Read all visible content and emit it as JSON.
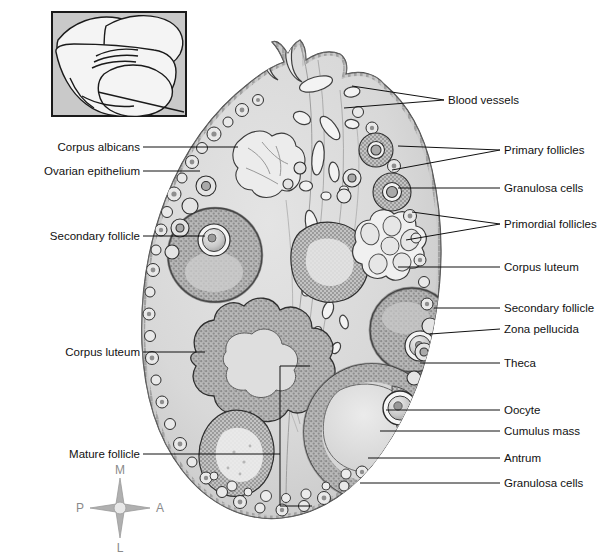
{
  "figure": {
    "kind": "anatomical-illustration",
    "background_color": "#ffffff",
    "line_color": "#111111",
    "stroma_fill": "#d9d9d9",
    "cortex_fill": "#cfcfcf",
    "follicle_fill": "#b4b4b4",
    "lumen_fill": "#e3e3e3",
    "vessel_fill": "#f2f2f2"
  },
  "inset": {
    "name": "orientation-inset",
    "description": "Hand holding ovary with sectioning plane line",
    "border_color": "#1a1a1a",
    "fill": "#c9c9c9"
  },
  "labels_left": [
    {
      "id": "corpus-albicans",
      "text": "Corpus albicans",
      "text_x": 140,
      "text_y": 151,
      "line_x1": 143,
      "line_y1": 147,
      "line_x2": 238,
      "line_y2": 147,
      "fork": false
    },
    {
      "id": "ovarian-epithelium",
      "text": "Ovarian epithelium",
      "text_x": 140,
      "text_y": 175,
      "line_x1": 143,
      "line_y1": 171,
      "line_x2": 200,
      "line_y2": 171,
      "fork": false
    },
    {
      "id": "secondary-follicle-left",
      "text": "Secondary follicle",
      "text_x": 140,
      "text_y": 240,
      "line_x1": 143,
      "line_y1": 236,
      "line_x2": 205,
      "line_y2": 236,
      "fork": false
    },
    {
      "id": "corpus-luteum-left",
      "text": "Corpus luteum",
      "text_x": 140,
      "text_y": 356,
      "line_x1": 143,
      "line_y1": 352,
      "line_x2": 205,
      "line_y2": 352,
      "fork": false
    },
    {
      "id": "mature-follicle",
      "text": "Mature follicle",
      "text_x": 140,
      "text_y": 458,
      "line_x1": 143,
      "line_y1": 454,
      "line_x2": 280,
      "line_y2": 454,
      "fork": false
    }
  ],
  "labels_right": [
    {
      "id": "blood-vessels",
      "text": "Blood vessels",
      "text_x": 448,
      "text_y": 104,
      "line_x1": 444,
      "line_y1": 100,
      "line_x2": 352,
      "line_y2": 86,
      "fork": true,
      "fork_x2": 344,
      "fork_y2": 108
    },
    {
      "id": "primary-follicles",
      "text": "Primary follicles",
      "text_x": 504,
      "text_y": 154,
      "line_x1": 500,
      "line_y1": 150,
      "line_x2": 398,
      "line_y2": 146,
      "fork": true,
      "fork_x2": 392,
      "fork_y2": 170
    },
    {
      "id": "granulosa-cells-top",
      "text": "Granulosa cells",
      "text_x": 504,
      "text_y": 192,
      "line_x1": 500,
      "line_y1": 188,
      "line_x2": 398,
      "line_y2": 188,
      "fork": false
    },
    {
      "id": "primordial-follicles",
      "text": "Primordial follicles",
      "text_x": 504,
      "text_y": 228,
      "line_x1": 500,
      "line_y1": 224,
      "line_x2": 412,
      "line_y2": 212,
      "fork": true,
      "fork_x2": 406,
      "fork_y2": 240
    },
    {
      "id": "corpus-luteum-right",
      "text": "Corpus luteum",
      "text_x": 504,
      "text_y": 271,
      "line_x1": 500,
      "line_y1": 267,
      "line_x2": 398,
      "line_y2": 267,
      "fork": false
    },
    {
      "id": "secondary-follicle-right",
      "text": "Secondary follicle",
      "text_x": 504,
      "text_y": 312,
      "line_x1": 500,
      "line_y1": 308,
      "line_x2": 434,
      "line_y2": 308,
      "fork": false
    },
    {
      "id": "zona-pellucida",
      "text": "Zona pellucida",
      "text_x": 504,
      "text_y": 333,
      "line_x1": 500,
      "line_y1": 329,
      "line_x2": 430,
      "line_y2": 334,
      "fork": false
    },
    {
      "id": "theca",
      "text": "Theca",
      "text_x": 504,
      "text_y": 367,
      "line_x1": 500,
      "line_y1": 363,
      "line_x2": 420,
      "line_y2": 363,
      "fork": false
    },
    {
      "id": "oocyte",
      "text": "Oocyte",
      "text_x": 504,
      "text_y": 414,
      "line_x1": 500,
      "line_y1": 410,
      "line_x2": 386,
      "line_y2": 410,
      "fork": false
    },
    {
      "id": "cumulus-mass",
      "text": "Cumulus mass",
      "text_x": 504,
      "text_y": 435,
      "line_x1": 500,
      "line_y1": 431,
      "line_x2": 380,
      "line_y2": 431,
      "fork": false
    },
    {
      "id": "antrum",
      "text": "Antrum",
      "text_x": 504,
      "text_y": 462,
      "line_x1": 500,
      "line_y1": 458,
      "line_x2": 368,
      "line_y2": 458,
      "fork": false
    },
    {
      "id": "granulosa-cells-bottom",
      "text": "Granulosa cells",
      "text_x": 504,
      "text_y": 487,
      "line_x1": 500,
      "line_y1": 483,
      "line_x2": 360,
      "line_y2": 483,
      "fork": false
    }
  ],
  "compass": {
    "name": "orientation-compass",
    "center_x": 120,
    "center_y": 508,
    "color": "#9a9a9a",
    "directions": {
      "top": "M",
      "right": "A",
      "bottom": "L",
      "left": "P"
    }
  }
}
